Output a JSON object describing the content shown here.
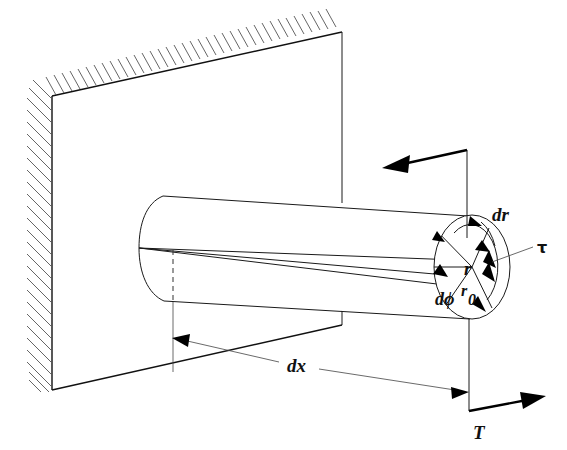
{
  "figure": {
    "background_color": "#ffffff",
    "line_color": "#111111"
  },
  "labels": {
    "dr": "dr",
    "tau": "τ",
    "r": "r",
    "r0_base": "r",
    "r0_sub": "0",
    "dphi": "dϕ",
    "dx": "dx",
    "T": "T"
  },
  "elements": {
    "wall": "wall",
    "hatching": "fixed-support-hatching",
    "shaft": "circular-shaft",
    "end_face": "shaft-end-face",
    "torque_arrow_top": "torque-direction-arrow",
    "torque_arrow_bottom": "applied-torque-T",
    "dimension_dx": "axial-length-dimension",
    "shear_stress_arrow": "shear-stress-tau-arrow",
    "radial_element": "radial-element-dr",
    "angular_element": "angular-element-dphi"
  },
  "geometry": {
    "wall_top_left_x": 52,
    "wall_top_left_y": 96,
    "wall_top_right_x": 342,
    "wall_top_right_y": 32,
    "wall_bottom_right_x": 342,
    "wall_bottom_right_y": 325,
    "wall_bottom_left_x": 52,
    "wall_bottom_left_y": 390,
    "shaft_left_cap_cx": 160,
    "shaft_left_cap_cy": 248,
    "shaft_right_face_cx": 472,
    "shaft_right_face_cy": 267,
    "shaft_right_rx": 38,
    "shaft_right_ry": 52
  }
}
